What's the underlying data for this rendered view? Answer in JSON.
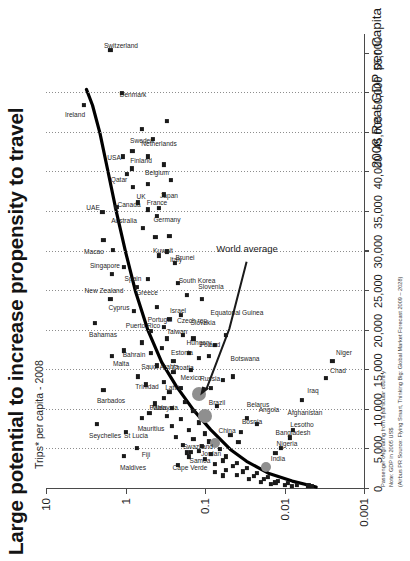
{
  "header": {
    "title": "Large potential to increase propensity to travel",
    "subtitle": "Trips* per capita - 2008"
  },
  "footnotes": {
    "line1": "Passenger originating from a particular country",
    "line2": "Note: GDP in 2005 US$",
    "line3": "(Airbus PR Source: Flying Smart, Thinking Big: Global Market Forecast 2009 – 2028)"
  },
  "annotations": {
    "world_average": "World average"
  },
  "colors": {
    "point": "#1a1a1a",
    "bric": "#8f8f8f",
    "curve": "#000000",
    "axis": "#4a4a4a",
    "grid": "#8d8d8d"
  },
  "chart_data": {
    "type": "scatter",
    "title": "Large potential to increase propensity to travel",
    "subtitle": "Trips* per capita - 2008",
    "xlabel": "2008 Real GDP per Capita",
    "ylabel": "Trips* per capita - 2008",
    "xlim": [
      0,
      57500
    ],
    "ylim": [
      0.001,
      10
    ],
    "yscale": "log",
    "xticks": [
      0,
      5000,
      10000,
      15000,
      20000,
      25000,
      30000,
      35000,
      40000,
      45000,
      50000,
      55000
    ],
    "xticklabels": [
      "0",
      "5,000",
      "10,000",
      "15,000",
      "20,000",
      "25,000",
      "30,000",
      "35,000",
      "40,000",
      "45,000",
      "50,000",
      "55,000"
    ],
    "yticks": [
      10,
      1,
      0.1,
      0.01,
      0.001
    ],
    "yticklabels": [
      "10",
      "1",
      "0.1",
      "0.01",
      "0.001"
    ],
    "gridlines_x": [
      5000,
      10000,
      15000,
      20000,
      25000,
      30000,
      35000,
      40000,
      45000,
      50000
    ],
    "grid": true,
    "legend": false,
    "points": [
      {
        "label": "Ireland",
        "x": 48500,
        "y": 3.3,
        "lx": -10,
        "ly": -9
      },
      {
        "label": "Switzerland",
        "x": 55500,
        "y": 1.55,
        "lx": 4,
        "ly": 11
      },
      {
        "label": "Denmark",
        "x": 50000,
        "y": 1.12,
        "lx": -2,
        "ly": 11
      },
      {
        "label": "USA",
        "x": 42000,
        "y": 1.08,
        "lx": -1,
        "ly": -9
      },
      {
        "label": "Sweden",
        "x": 42700,
        "y": 0.82,
        "lx": 10,
        "ly": 10
      },
      {
        "label": "Netherlands",
        "x": 42000,
        "y": 0.52,
        "lx": 13,
        "ly": 11
      },
      {
        "label": "Qatar",
        "x": 39800,
        "y": 0.95,
        "lx": -6,
        "ly": -8
      },
      {
        "label": "Finland",
        "x": 40500,
        "y": 0.83,
        "lx": 8,
        "ly": 9
      },
      {
        "label": "UK",
        "x": 38200,
        "y": 0.8,
        "lx": -10,
        "ly": 8
      },
      {
        "label": "Belgium",
        "x": 38500,
        "y": 0.52,
        "lx": 11,
        "ly": 9
      },
      {
        "label": "Canada",
        "x": 36200,
        "y": 0.7,
        "lx": -2,
        "ly": -9
      },
      {
        "label": "France",
        "x": 35300,
        "y": 0.52,
        "lx": 7,
        "ly": 9
      },
      {
        "label": "Germany",
        "x": 34500,
        "y": 0.4,
        "lx": -4,
        "ly": 10
      },
      {
        "label": "Japan",
        "x": 35500,
        "y": 0.38,
        "lx": 12,
        "ly": 10
      },
      {
        "label": "Australia",
        "x": 35600,
        "y": 1.3,
        "lx": -14,
        "ly": 8
      },
      {
        "label": "UAE",
        "x": 35000,
        "y": 1.95,
        "lx": 4,
        "ly": -9
      },
      {
        "label": "Macao",
        "x": 31500,
        "y": 1.9,
        "lx": -12,
        "ly": -9
      },
      {
        "label": "Kuwait",
        "x": 31800,
        "y": 0.42,
        "lx": -14,
        "ly": 8
      },
      {
        "label": "Italy",
        "x": 30000,
        "y": 0.3,
        "lx": -8,
        "ly": 9
      },
      {
        "label": "Singapore",
        "x": 30200,
        "y": 1.45,
        "lx": -16,
        "ly": -8
      },
      {
        "label": "New Zealand",
        "x": 27200,
        "y": 1.5,
        "lx": -17,
        "ly": -8
      },
      {
        "label": "Spain",
        "x": 28000,
        "y": 1.05,
        "lx": -12,
        "ly": 9
      },
      {
        "label": "Greece",
        "x": 25500,
        "y": 0.72,
        "lx": -6,
        "ly": 10
      },
      {
        "label": "Brunei",
        "x": 28500,
        "y": 0.24,
        "lx": 5,
        "ly": 10
      },
      {
        "label": "South Korea",
        "x": 24500,
        "y": 0.17,
        "lx": 14,
        "ly": 10
      },
      {
        "label": "Bahamas",
        "x": 21000,
        "y": 2.4,
        "lx": -12,
        "ly": 8
      },
      {
        "label": "Cyprus",
        "x": 24000,
        "y": 1.55,
        "lx": -9,
        "ly": 9
      },
      {
        "label": "Puerto Rico",
        "x": 22500,
        "y": 0.78,
        "lx": -15,
        "ly": 9
      },
      {
        "label": "Slovenia",
        "x": 24000,
        "y": 0.11,
        "lx": 12,
        "ly": 9
      },
      {
        "label": "Israel",
        "x": 21500,
        "y": 0.28,
        "lx": 8,
        "ly": 9
      },
      {
        "label": "Portugal",
        "x": 20000,
        "y": 0.48,
        "lx": 11,
        "ly": 9
      },
      {
        "label": "Taiwan",
        "x": 19000,
        "y": 0.3,
        "lx": 7,
        "ly": 10
      },
      {
        "label": "Czech rep.",
        "x": 19500,
        "y": 0.19,
        "lx": 14,
        "ly": 10
      },
      {
        "label": "Malta",
        "x": 16800,
        "y": 1.5,
        "lx": -8,
        "ly": 9
      },
      {
        "label": "Bahrain",
        "x": 17500,
        "y": 1.05,
        "lx": -4,
        "ly": 10
      },
      {
        "label": "Saudi Arabia",
        "x": 17200,
        "y": 0.48,
        "lx": -14,
        "ly": 9
      },
      {
        "label": "Trinidad",
        "x": 14200,
        "y": 0.7,
        "lx": -10,
        "ly": 9
      },
      {
        "label": "Barbados",
        "x": 12500,
        "y": 1.9,
        "lx": -11,
        "ly": 8
      },
      {
        "label": "Seychelles",
        "x": 8200,
        "y": 2.3,
        "lx": -12,
        "ly": 8
      },
      {
        "label": "Maldives",
        "x": 4200,
        "y": 1.05,
        "lx": -12,
        "ly": 9
      },
      {
        "label": "St Lucia",
        "x": 7200,
        "y": 1.0,
        "lx": -4,
        "ly": 10
      },
      {
        "label": "Mauritius",
        "x": 9000,
        "y": 0.62,
        "lx": -11,
        "ly": 9
      },
      {
        "label": "Fiji",
        "x": 5200,
        "y": 0.72,
        "lx": -7,
        "ly": 9
      },
      {
        "label": "Malaysia",
        "x": 10800,
        "y": 0.43,
        "lx": -4,
        "ly": 10
      },
      {
        "label": "Palau",
        "x": 9600,
        "y": 0.5,
        "lx": 5,
        "ly": 9
      },
      {
        "label": "Latvia",
        "x": 13500,
        "y": 0.33,
        "lx": -6,
        "ly": 10
      },
      {
        "label": "Croatia",
        "x": 14800,
        "y": 0.25,
        "lx": 4,
        "ly": 10
      },
      {
        "label": "Estonia",
        "x": 16200,
        "y": 0.25,
        "lx": 8,
        "ly": 9
      },
      {
        "label": "Mexico",
        "x": 12800,
        "y": 0.2,
        "lx": 10,
        "ly": 10
      },
      {
        "label": "Hungary",
        "x": 17200,
        "y": 0.16,
        "lx": 10,
        "ly": 10
      },
      {
        "label": "Slovakia",
        "x": 19000,
        "y": 0.14,
        "lx": 16,
        "ly": 10
      },
      {
        "label": "Poland",
        "x": 16500,
        "y": 0.12,
        "lx": 13,
        "ly": 11
      },
      {
        "label": "Equatorial Guinea",
        "x": 19500,
        "y": 0.055,
        "lx": 22,
        "ly": 11
      },
      {
        "label": "Botswana",
        "x": 14200,
        "y": 0.045,
        "lx": 18,
        "ly": 12
      },
      {
        "label": "Cape Verde",
        "x": 3000,
        "y": 0.22,
        "lx": -3,
        "ly": 12
      },
      {
        "label": "Samoa",
        "x": 4100,
        "y": 0.16,
        "lx": -4,
        "ly": 11
      },
      {
        "label": "Jordan",
        "x": 4800,
        "y": 0.12,
        "lx": -3,
        "ly": 12
      },
      {
        "label": "Swaziland",
        "x": 4600,
        "y": 0.17,
        "lx": 6,
        "ly": 11
      },
      {
        "label": "Brazil",
        "x": 9200,
        "y": 0.1,
        "lx": 13,
        "ly": 12,
        "bric": true
      },
      {
        "label": "Russia",
        "x": 12000,
        "y": 0.12,
        "lx": 15,
        "ly": 11,
        "bric": true
      },
      {
        "label": "China",
        "x": 5800,
        "y": 0.075,
        "lx": 12,
        "ly": 12,
        "bric": true,
        "small": true
      },
      {
        "label": "India",
        "x": 2800,
        "y": 0.017,
        "lx": 8,
        "ly": 12,
        "bric": true,
        "small": true
      },
      {
        "label": "Bosnia",
        "x": 7200,
        "y": 0.035,
        "lx": 10,
        "ly": 11
      },
      {
        "label": "Belarus",
        "x": 9000,
        "y": 0.03,
        "lx": 13,
        "ly": 11
      },
      {
        "label": "Angola",
        "x": 8200,
        "y": 0.022,
        "lx": 14,
        "ly": 12
      },
      {
        "label": "Nigeria",
        "x": 4500,
        "y": 0.013,
        "lx": 9,
        "ly": 12
      },
      {
        "label": "Bangladesh",
        "x": 5200,
        "y": 0.011,
        "lx": 15,
        "ly": 12
      },
      {
        "label": "Lesotho",
        "x": 6500,
        "y": 0.0085,
        "lx": 13,
        "ly": 12
      },
      {
        "label": "Afghanistan",
        "x": 7400,
        "y": 0.0078,
        "lx": 17,
        "ly": 12
      },
      {
        "label": "Iraq",
        "x": 11200,
        "y": 0.006,
        "lx": 9,
        "ly": 11
      },
      {
        "label": "Chad",
        "x": 14000,
        "y": 0.003,
        "lx": 7,
        "ly": 12
      },
      {
        "label": "Niger",
        "x": 16200,
        "y": 0.0025,
        "lx": 8,
        "ly": 12
      }
    ],
    "unlabeled_points": [
      {
        "x": 45500,
        "y": 0.62
      },
      {
        "x": 44200,
        "y": 0.45
      },
      {
        "x": 46500,
        "y": 0.3
      },
      {
        "x": 41000,
        "y": 0.33
      },
      {
        "x": 39000,
        "y": 0.27
      },
      {
        "x": 37200,
        "y": 0.33
      },
      {
        "x": 33000,
        "y": 0.6
      },
      {
        "x": 32000,
        "y": 0.28
      },
      {
        "x": 29500,
        "y": 0.38
      },
      {
        "x": 26500,
        "y": 0.52
      },
      {
        "x": 26000,
        "y": 0.22
      },
      {
        "x": 23000,
        "y": 0.4
      },
      {
        "x": 22000,
        "y": 0.2
      },
      {
        "x": 20500,
        "y": 0.33
      },
      {
        "x": 18500,
        "y": 0.62
      },
      {
        "x": 17800,
        "y": 0.35
      },
      {
        "x": 15600,
        "y": 0.4
      },
      {
        "x": 15000,
        "y": 0.15
      },
      {
        "x": 13200,
        "y": 0.55
      },
      {
        "x": 12200,
        "y": 0.28
      },
      {
        "x": 11500,
        "y": 0.33
      },
      {
        "x": 11000,
        "y": 0.18
      },
      {
        "x": 10200,
        "y": 0.26
      },
      {
        "x": 9800,
        "y": 0.14
      },
      {
        "x": 9200,
        "y": 0.3
      },
      {
        "x": 8800,
        "y": 0.2
      },
      {
        "x": 8400,
        "y": 0.12
      },
      {
        "x": 7900,
        "y": 0.26
      },
      {
        "x": 7400,
        "y": 0.16
      },
      {
        "x": 7000,
        "y": 0.1
      },
      {
        "x": 6600,
        "y": 0.23
      },
      {
        "x": 6300,
        "y": 0.14
      },
      {
        "x": 6000,
        "y": 0.09
      },
      {
        "x": 5600,
        "y": 0.19
      },
      {
        "x": 5400,
        "y": 0.11
      },
      {
        "x": 5000,
        "y": 0.065
      },
      {
        "x": 4700,
        "y": 0.15
      },
      {
        "x": 4400,
        "y": 0.085
      },
      {
        "x": 4100,
        "y": 0.055
      },
      {
        "x": 3800,
        "y": 0.1
      },
      {
        "x": 3600,
        "y": 0.06
      },
      {
        "x": 3300,
        "y": 0.04
      },
      {
        "x": 3100,
        "y": 0.075
      },
      {
        "x": 2900,
        "y": 0.045
      },
      {
        "x": 2600,
        "y": 0.03
      },
      {
        "x": 2400,
        "y": 0.055
      },
      {
        "x": 2200,
        "y": 0.033
      },
      {
        "x": 2000,
        "y": 0.022
      },
      {
        "x": 1800,
        "y": 0.04
      },
      {
        "x": 1600,
        "y": 0.024
      },
      {
        "x": 1500,
        "y": 0.016
      },
      {
        "x": 1300,
        "y": 0.028
      },
      {
        "x": 1200,
        "y": 0.018
      },
      {
        "x": 1050,
        "y": 0.012
      },
      {
        "x": 900,
        "y": 0.02
      },
      {
        "x": 800,
        "y": 0.013
      },
      {
        "x": 700,
        "y": 0.009
      },
      {
        "x": 620,
        "y": 0.015
      },
      {
        "x": 540,
        "y": 0.01
      },
      {
        "x": 470,
        "y": 0.007
      },
      {
        "x": 420,
        "y": 0.005
      },
      {
        "x": 380,
        "y": 0.008
      },
      {
        "x": 330,
        "y": 0.0045
      },
      {
        "x": 12800,
        "y": 0.085
      },
      {
        "x": 13800,
        "y": 0.06
      },
      {
        "x": 10500,
        "y": 0.07
      },
      {
        "x": 16800,
        "y": 0.09
      },
      {
        "x": 18200,
        "y": 0.075
      },
      {
        "x": 2100,
        "y": 0.075
      },
      {
        "x": 1700,
        "y": 0.06
      },
      {
        "x": 6800,
        "y": 0.048
      },
      {
        "x": 5900,
        "y": 0.038
      }
    ],
    "trend_curve": {
      "label": "fitted propensity curve",
      "points": [
        {
          "x": 250,
          "y": 0.004
        },
        {
          "x": 1000,
          "y": 0.008
        },
        {
          "x": 2000,
          "y": 0.016
        },
        {
          "x": 3500,
          "y": 0.03
        },
        {
          "x": 5000,
          "y": 0.048
        },
        {
          "x": 7500,
          "y": 0.085
        },
        {
          "x": 10000,
          "y": 0.14
        },
        {
          "x": 13000,
          "y": 0.23
        },
        {
          "x": 16000,
          "y": 0.35
        },
        {
          "x": 20000,
          "y": 0.52
        },
        {
          "x": 25000,
          "y": 0.75
        },
        {
          "x": 30000,
          "y": 1.0
        },
        {
          "x": 35000,
          "y": 1.3
        },
        {
          "x": 40000,
          "y": 1.65
        },
        {
          "x": 45000,
          "y": 2.1
        },
        {
          "x": 48500,
          "y": 2.6
        },
        {
          "x": 50500,
          "y": 3.1
        }
      ]
    },
    "world_average_annotation": {
      "text": "World average",
      "label_x": 30500,
      "label_y": 0.03,
      "target_x": 11800,
      "target_y": 0.115
    }
  }
}
